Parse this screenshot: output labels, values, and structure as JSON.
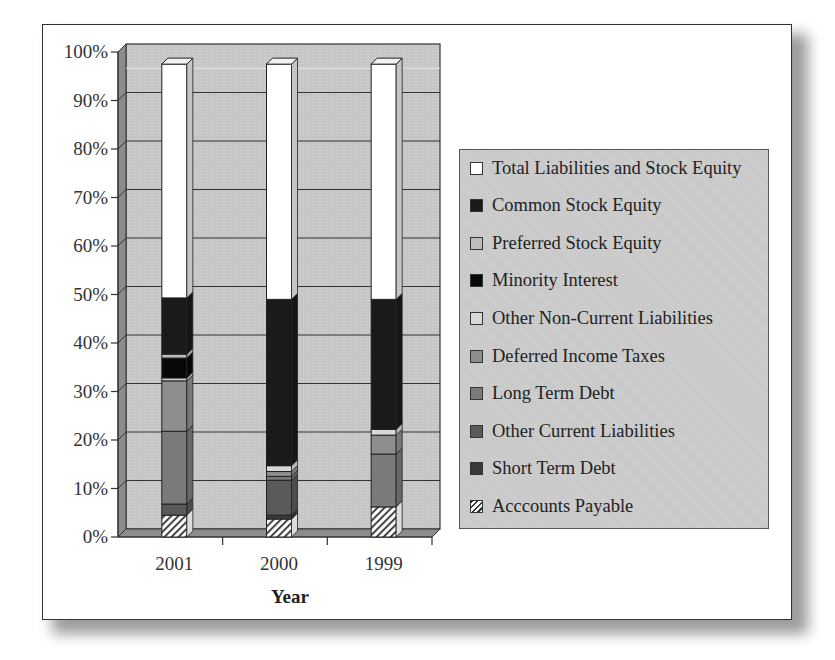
{
  "chart_data": {
    "type": "bar",
    "subtype": "stacked_3d_100_percent",
    "title": "",
    "xlabel": "Year",
    "ylabel": "",
    "ylim": [
      0,
      100
    ],
    "yticks": [
      "0%",
      "10%",
      "20%",
      "30%",
      "40%",
      "50%",
      "60%",
      "70%",
      "80%",
      "90%",
      "100%"
    ],
    "grid": true,
    "legend_position": "right",
    "categories": [
      "2001",
      "2000",
      "1999"
    ],
    "series": [
      {
        "name": "Acccounts Payable",
        "color": "hatched",
        "values": [
          4.5,
          3.7,
          6.2
        ]
      },
      {
        "name": "Short Term Debt",
        "color": "#3a3a3a",
        "values": [
          0.0,
          0.8,
          0.0
        ]
      },
      {
        "name": "Other Current Liabilities",
        "color": "#5a5a5a",
        "values": [
          2.3,
          7.2,
          0.0
        ]
      },
      {
        "name": "Long Term Debt",
        "color": "#7a7a7a",
        "values": [
          15.0,
          0.8,
          10.9
        ]
      },
      {
        "name": "Deferred Income Taxes",
        "color": "#8e8e8e",
        "values": [
          10.4,
          1.0,
          3.9
        ]
      },
      {
        "name": "Other Non-Current Liabilities",
        "color": "#d8d8d8",
        "values": [
          0.6,
          1.2,
          1.2
        ]
      },
      {
        "name": "Minority Interest",
        "color": "#080808",
        "values": [
          4.1,
          0.0,
          0.0
        ]
      },
      {
        "name": "Preferred Stock Equity",
        "color": "#bdbdbd",
        "values": [
          0.8,
          0.0,
          0.0
        ]
      },
      {
        "name": "Common Stock Equity",
        "color": "#1a1a1a",
        "values": [
          11.6,
          34.3,
          26.8
        ]
      },
      {
        "name": "Total Liabilities and Stock Equity",
        "color": "#ffffff",
        "values": [
          48.2,
          48.5,
          48.5
        ]
      }
    ]
  },
  "legend": {
    "items": [
      {
        "label": "Total Liabilities and Stock Equity",
        "swatch": "#ffffff"
      },
      {
        "label": "Common Stock Equity",
        "swatch": "#1a1a1a"
      },
      {
        "label": "Preferred Stock Equity",
        "swatch": "#bdbdbd"
      },
      {
        "label": "Minority Interest",
        "swatch": "#080808"
      },
      {
        "label": "Other Non-Current Liabilities",
        "swatch": "#d8d8d8"
      },
      {
        "label": "Deferred Income Taxes",
        "swatch": "#8e8e8e"
      },
      {
        "label": "Long Term Debt",
        "swatch": "#7a7a7a"
      },
      {
        "label": "Other Current Liabilities",
        "swatch": "#5a5a5a"
      },
      {
        "label": "Short Term Debt",
        "swatch": "#3a3a3a"
      },
      {
        "label": "Acccounts Payable",
        "swatch": "hatched"
      }
    ]
  },
  "axis": {
    "x_label": "Year",
    "x_ticks": [
      "2001",
      "2000",
      "1999"
    ],
    "y_ticks": [
      "0%",
      "10%",
      "20%",
      "30%",
      "40%",
      "50%",
      "60%",
      "70%",
      "80%",
      "90%",
      "100%"
    ]
  },
  "colors": {
    "wall": "#c8c8c8",
    "side_wall": "#8c8c8c",
    "floor": "#8c8c8c",
    "grid": "#2a2a2a",
    "legend_bg": "#c9c9c9"
  }
}
